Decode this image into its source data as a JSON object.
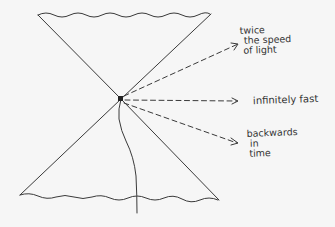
{
  "diagram": {
    "type": "light cone sketch",
    "labels": {
      "faster": [
        "twice",
        "the speed",
        "of light"
      ],
      "infinite": "infinitely fast",
      "backwards": [
        "backwards",
        "in",
        "time"
      ]
    },
    "colors": {
      "ink": "#3a3a3a",
      "background": "#f6f6f6"
    }
  }
}
